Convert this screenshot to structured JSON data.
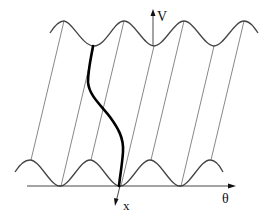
{
  "diagram": {
    "labels": {
      "vertical_axis": "V",
      "horizontal_axis": "θ",
      "downward_axis": "x"
    },
    "colors": {
      "curve": "#444444",
      "thin_lines": "#555555",
      "thick_path": "#000000",
      "axis": "#333333",
      "background": "#ffffff"
    },
    "curves": {
      "top_wave": {
        "period_px": 60,
        "peaks_x": [
          64,
          124,
          184,
          244
        ],
        "peak_y": 21,
        "trough_y": 46,
        "x_start": 50,
        "x_end": 258
      },
      "bottom_wave": {
        "period_px": 60,
        "peaks_x": [
          30,
          90,
          150,
          210
        ],
        "peak_y": 160,
        "trough_y": 186,
        "x_start": 15,
        "x_end": 223
      }
    },
    "connecting_lines": [
      [
        [
          31,
          160
        ],
        [
          64,
          21
        ]
      ],
      [
        [
          61,
          186
        ],
        [
          94,
          46
        ]
      ],
      [
        [
          91,
          160
        ],
        [
          124,
          21
        ]
      ],
      [
        [
          121,
          186
        ],
        [
          154,
          46
        ]
      ],
      [
        [
          151,
          160
        ],
        [
          184,
          21
        ]
      ],
      [
        [
          181,
          186
        ],
        [
          214,
          46
        ]
      ],
      [
        [
          211,
          160
        ],
        [
          244,
          21
        ]
      ]
    ],
    "thick_path_points": [
      [
        93,
        46
      ],
      [
        88,
        82
      ],
      [
        110,
        117
      ],
      [
        123,
        150
      ],
      [
        119,
        186
      ]
    ]
  }
}
